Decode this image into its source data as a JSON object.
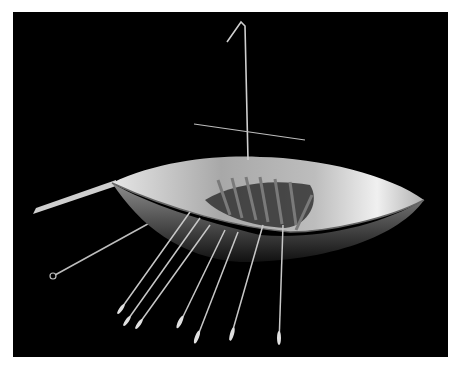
{
  "image": {
    "subject": "gold model boat with mast, yard, oars and steering oar",
    "background_color": "#000000",
    "page_color": "#ffffff",
    "tone": "grayscale",
    "parts": [
      "hull",
      "mast",
      "yard",
      "steering-oar",
      "oars",
      "thwarts",
      "wire-with-loop"
    ],
    "oar_count": 7
  }
}
